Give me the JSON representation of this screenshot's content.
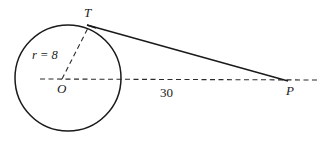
{
  "figure": {
    "type": "geometry-diagram",
    "stroke_color": "#1a1a1a",
    "background_color": "#ffffff",
    "labels": {
      "center": "O",
      "tangent_point": "T",
      "external_point": "P",
      "radius": "r = 8",
      "distance": "30"
    },
    "geometry": {
      "circle": {
        "cx": 68,
        "cy": 78,
        "r": 53
      },
      "tangent_point": {
        "x": 89,
        "y": 26
      },
      "external_point": {
        "x": 287,
        "y": 80
      },
      "axis_start": {
        "x": 40,
        "y": 79
      },
      "axis_end": {
        "x": 320,
        "y": 80
      }
    },
    "values": {
      "radius_length": 8,
      "segment_length": 30
    }
  }
}
